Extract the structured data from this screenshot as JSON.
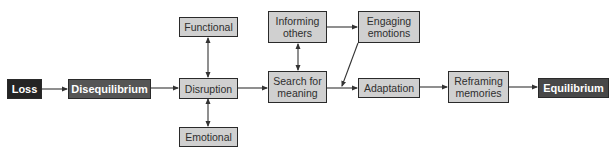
{
  "diagram": {
    "nodes": {
      "loss": {
        "label": "Loss",
        "style": "dark"
      },
      "disequilibrium": {
        "label": "Disequilibrium",
        "style": "mid"
      },
      "functional": {
        "label": "Functional",
        "style": "light"
      },
      "disruption": {
        "label": "Disruption",
        "style": "light"
      },
      "emotional": {
        "label": "Emotional",
        "style": "light"
      },
      "informing_others": {
        "label": "Informing others",
        "line1": "Informing",
        "line2": "others",
        "style": "light"
      },
      "search_for_meaning": {
        "label": "Search for meaning",
        "line1": "Search for",
        "line2": "meaning",
        "style": "light"
      },
      "engaging_emotions": {
        "label": "Engaging emotions",
        "line1": "Engaging",
        "line2": "emotions",
        "style": "light"
      },
      "adaptation": {
        "label": "Adaptation",
        "style": "light"
      },
      "reframing_memories": {
        "label": "Reframing memories",
        "line1": "Reframing",
        "line2": "memories",
        "style": "light"
      },
      "equilibrium": {
        "label": "Equilibrium",
        "style": "dark"
      }
    },
    "edges": [
      {
        "from": "Loss",
        "to": "Disequilibrium",
        "type": "directed"
      },
      {
        "from": "Disequilibrium",
        "to": "Disruption",
        "type": "directed"
      },
      {
        "from": "Disruption",
        "to": "Functional",
        "type": "bidirectional"
      },
      {
        "from": "Disruption",
        "to": "Emotional",
        "type": "bidirectional"
      },
      {
        "from": "Disruption",
        "to": "Search for meaning",
        "type": "directed"
      },
      {
        "from": "Search for meaning",
        "to": "Informing others",
        "type": "bidirectional"
      },
      {
        "from": "Informing others",
        "to": "Engaging emotions",
        "type": "directed"
      },
      {
        "from": "Engaging emotions",
        "to": "Search for meaning → Adaptation link",
        "type": "directed"
      },
      {
        "from": "Search for meaning",
        "to": "Adaptation",
        "type": "directed"
      },
      {
        "from": "Adaptation",
        "to": "Reframing memories",
        "type": "directed"
      },
      {
        "from": "Reframing memories",
        "to": "Equilibrium",
        "type": "directed"
      }
    ],
    "colors": {
      "dark_fill": "#242424",
      "mid_fill": "#555555",
      "light_fill": "#d0d0d0",
      "stroke": "#2a2a2a",
      "arrow": "#333333"
    }
  }
}
